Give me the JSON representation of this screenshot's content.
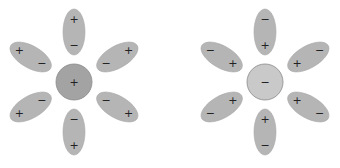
{
  "diagram": {
    "colors": {
      "petal_fill": "#b5b5b5",
      "cation_fill": "#a3a3a3",
      "anion_fill": "#c9c9c9",
      "sign_color": "#222222"
    },
    "clusters": [
      {
        "name": "cation-cluster",
        "center": {
          "x": 74,
          "y": 82,
          "r": 18
        },
        "ion_sign": "+",
        "petals": [
          {
            "angle": 0,
            "outer_sign": "+",
            "inner_sign": "−"
          },
          {
            "angle": 60,
            "outer_sign": "+",
            "inner_sign": "−"
          },
          {
            "angle": 120,
            "outer_sign": "+",
            "inner_sign": "−"
          },
          {
            "angle": 180,
            "outer_sign": "+",
            "inner_sign": "−"
          },
          {
            "angle": 240,
            "outer_sign": "+",
            "inner_sign": "−"
          },
          {
            "angle": 300,
            "outer_sign": "+",
            "inner_sign": "−"
          }
        ]
      },
      {
        "name": "anion-cluster",
        "center": {
          "x": 265,
          "y": 82,
          "r": 18
        },
        "ion_sign": "−",
        "petals": [
          {
            "angle": 0,
            "outer_sign": "−",
            "inner_sign": "+"
          },
          {
            "angle": 60,
            "outer_sign": "−",
            "inner_sign": "+"
          },
          {
            "angle": 120,
            "outer_sign": "−",
            "inner_sign": "+"
          },
          {
            "angle": 180,
            "outer_sign": "−",
            "inner_sign": "+"
          },
          {
            "angle": 240,
            "outer_sign": "−",
            "inner_sign": "+"
          },
          {
            "angle": 300,
            "outer_sign": "−",
            "inner_sign": "+"
          }
        ]
      }
    ]
  }
}
